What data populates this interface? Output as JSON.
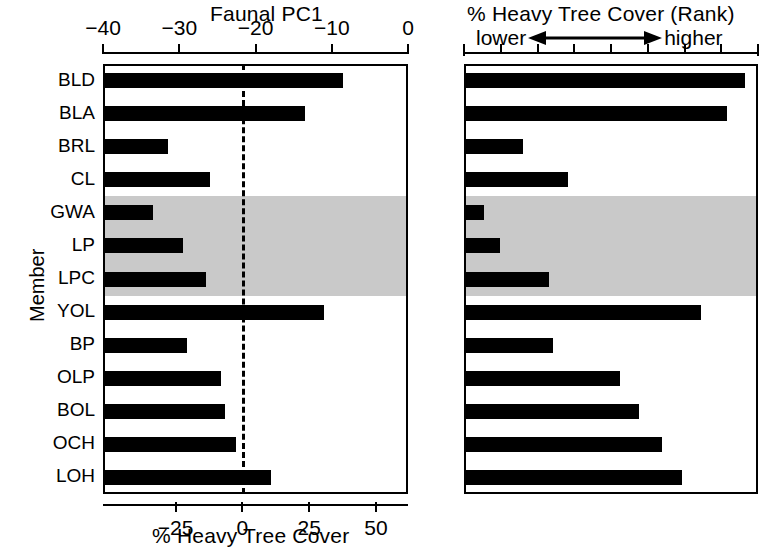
{
  "figure": {
    "member_axis_label": "Member",
    "left_panel": {
      "top_title": "Faunal PC1",
      "bottom_title": "% Heavy Tree Cover",
      "top_ticks": [
        "-40",
        "-30",
        "-20",
        "-10",
        "0"
      ],
      "bottom_ticks": [
        "-25",
        "0",
        "25",
        "50"
      ]
    },
    "right_panel": {
      "top_title": "% Heavy Tree Cover (Rank)",
      "left_word": "lower",
      "right_word": "higher",
      "arrow_icon": "double-headed-arrow-icon"
    }
  },
  "chart_data": [
    {
      "type": "bar",
      "orientation": "horizontal",
      "title": "Faunal PC1",
      "xlabel": "% Heavy Tree Cover",
      "ylabel": "Member",
      "top_axis_label": "Faunal PC1",
      "top_axis_ticks": [
        -40,
        -30,
        -20,
        -10,
        0
      ],
      "top_axis_range": [
        -40,
        0
      ],
      "bottom_axis_label": "% Heavy Tree Cover",
      "bottom_axis_ticks": [
        -25,
        0,
        25,
        50
      ],
      "bottom_axis_range": [
        -52.2,
        62.0
      ],
      "grid": false,
      "reference_line": {
        "value": 0,
        "axis": "bottom",
        "style": "dashed"
      },
      "shaded_rows": [
        "GWA",
        "LP",
        "LPC"
      ],
      "shade_color": "#c9c9c9",
      "bar_color": "#000000",
      "categories": [
        "BLD",
        "BLA",
        "BRL",
        "CL",
        "GWA",
        "LP",
        "LPC",
        "YOL",
        "BP",
        "OLP",
        "BOL",
        "OCH",
        "LOH"
      ],
      "values_bottom_axis_percent_heavy_tree_cover": [
        -6.5,
        -15.0,
        -37.0,
        -27.5,
        -41.0,
        -34.5,
        -28.0,
        -11.0,
        -33.0,
        -4.5,
        -4.0,
        -1.0,
        7.0
      ],
      "values_top_axis_faunal_pc1_bar_end": [
        -8.5,
        -13.5,
        -31.5,
        -26.0,
        -33.5,
        -29.5,
        -26.5,
        -11.0,
        -29.0,
        -24.5,
        -24.0,
        -22.5,
        -18.0
      ]
    },
    {
      "type": "bar",
      "orientation": "horizontal",
      "title": "% Heavy Tree Cover (Rank)",
      "xlabel": "% Heavy Tree Cover (Rank)",
      "ylabel": "Member",
      "grid": false,
      "axis_direction_low": "lower",
      "axis_direction_high": "higher",
      "n_ticks": 8,
      "shaded_rows": [
        "GWA",
        "LP",
        "LPC"
      ],
      "shade_color": "#c9c9c9",
      "bar_color": "#000000",
      "categories": [
        "BLD",
        "BLA",
        "BRL",
        "CL",
        "GWA",
        "LP",
        "LPC",
        "YOL",
        "BP",
        "OLP",
        "BOL",
        "OCH",
        "LOH"
      ],
      "rank_values": [
        13,
        12,
        3,
        5,
        1,
        2,
        4,
        11,
        6,
        7,
        8,
        9,
        10
      ],
      "bar_fraction_of_axis": [
        0.955,
        0.893,
        0.2,
        0.353,
        0.068,
        0.122,
        0.288,
        0.806,
        0.302,
        0.53,
        0.595,
        0.673,
        0.741
      ]
    }
  ]
}
